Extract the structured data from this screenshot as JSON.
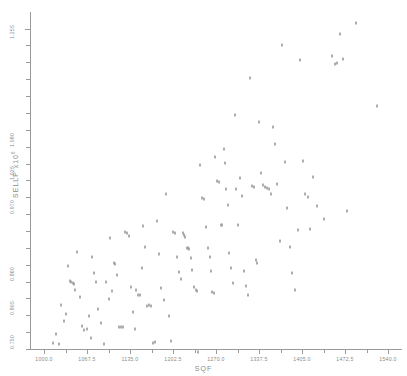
{
  "header": {
    "smudge_text": "· · ·"
  },
  "axis": {
    "x_title": "SQF",
    "y_title_main": "SELLP  x10",
    "y_title_exp": "6"
  },
  "chart_data": {
    "type": "scatter",
    "title": "",
    "xlabel": "SQF",
    "ylabel": "SELLP x10^6",
    "grid": false,
    "legend": null,
    "xlim": [
      978.0,
      1562.0
    ],
    "ylim": [
      0.7335,
      1.283
    ],
    "xticks": [
      1000.0,
      1067.5,
      1135.0,
      1202.5,
      1270.0,
      1337.5,
      1405.0,
      1472.5,
      1540.0
    ],
    "xtick_labels": [
      "1000.0",
      "1067.5",
      "1135.0",
      "1202.5",
      "1270.0",
      "1337.5",
      "1405.0",
      "1472.5",
      "1540.0"
    ],
    "x_minor_step": 33.75,
    "yticks": [
      0.75,
      0.805,
      0.86,
      0.915,
      0.97,
      1.025,
      1.08,
      1.135,
      1.19,
      1.255
    ],
    "ytick_labels": [
      "0.750",
      "0.805",
      "0.860",
      "0.915",
      "0.970",
      "1.025",
      "1.080",
      "1.135",
      "1.190",
      "1.255"
    ],
    "labeled_yticks": [
      "0.750",
      "0.805",
      "0.860",
      "0.970",
      "1.025",
      "1.080",
      "1.255"
    ],
    "marker": "small-dot",
    "n_points": 142,
    "points": [
      [
        1014,
        0.743
      ],
      [
        1019,
        0.758
      ],
      [
        1023,
        0.742
      ],
      [
        1027,
        0.8055
      ],
      [
        1031,
        0.78
      ],
      [
        1035,
        0.79
      ],
      [
        1038,
        0.869
      ],
      [
        1040,
        0.844
      ],
      [
        1043,
        0.843
      ],
      [
        1045,
        0.841
      ],
      [
        1047,
        0.839
      ],
      [
        1049,
        0.8295
      ],
      [
        1052,
        0.891
      ],
      [
        1056,
        0.818
      ],
      [
        1060,
        0.771
      ],
      [
        1063,
        0.764
      ],
      [
        1067,
        0.767
      ],
      [
        1070,
        0.787
      ],
      [
        1073,
        0.752
      ],
      [
        1076,
        0.883
      ],
      [
        1079,
        0.858
      ],
      [
        1082,
        0.843
      ],
      [
        1085,
        0.798
      ],
      [
        1090,
        0.776
      ],
      [
        1094,
        0.742
      ],
      [
        1098,
        0.843
      ],
      [
        1102,
        0.815
      ],
      [
        1104,
        0.914
      ],
      [
        1107,
        0.828
      ],
      [
        1110,
        0.873
      ],
      [
        1112,
        0.872
      ],
      [
        1115,
        0.854
      ],
      [
        1118,
        0.77
      ],
      [
        1121,
        0.77
      ],
      [
        1124,
        0.769
      ],
      [
        1127,
        0.924
      ],
      [
        1130,
        0.923
      ],
      [
        1133,
        0.918
      ],
      [
        1136,
        0.835
      ],
      [
        1139,
        0.794
      ],
      [
        1142,
        0.766
      ],
      [
        1145,
        0.829
      ],
      [
        1148,
        0.822
      ],
      [
        1151,
        0.821
      ],
      [
        1153,
        0.866
      ],
      [
        1156,
        0.934
      ],
      [
        1159,
        0.9
      ],
      [
        1162,
        0.804
      ],
      [
        1165,
        0.805
      ],
      [
        1168,
        0.803
      ],
      [
        1171,
        0.744
      ],
      [
        1174,
        0.745
      ],
      [
        1177,
        0.942
      ],
      [
        1180,
        0.888
      ],
      [
        1184,
        0.833
      ],
      [
        1188,
        0.813
      ],
      [
        1192,
        0.987
      ],
      [
        1196,
        0.788
      ],
      [
        1200,
        0.746
      ],
      [
        1203,
        0.924
      ],
      [
        1206,
        0.923
      ],
      [
        1209,
        0.883
      ],
      [
        1212,
        0.859
      ],
      [
        1215,
        0.847
      ],
      [
        1218,
        0.922
      ],
      [
        1220,
        0.92
      ],
      [
        1222,
        0.916
      ],
      [
        1224,
        0.899
      ],
      [
        1226,
        0.898
      ],
      [
        1228,
        0.896
      ],
      [
        1230,
        0.882
      ],
      [
        1233,
        0.862
      ],
      [
        1236,
        0.835
      ],
      [
        1238,
        0.83
      ],
      [
        1240,
        0.828
      ],
      [
        1242,
        0.729
      ],
      [
        1245,
        1.034
      ],
      [
        1248,
        0.979
      ],
      [
        1251,
        0.978
      ],
      [
        1254,
        0.932
      ],
      [
        1257,
        0.898
      ],
      [
        1260,
        0.884
      ],
      [
        1262,
        0.861
      ],
      [
        1264,
        0.826
      ],
      [
        1266,
        0.825
      ],
      [
        1269,
        1.047
      ],
      [
        1272,
        1.007
      ],
      [
        1275,
        1.006
      ],
      [
        1277,
        0.936
      ],
      [
        1280,
        0.935
      ],
      [
        1282,
        1.06
      ],
      [
        1284,
        1.037
      ],
      [
        1286,
        0.995
      ],
      [
        1288,
        0.968
      ],
      [
        1290,
        0.89
      ],
      [
        1293,
        0.865
      ],
      [
        1296,
        0.842
      ],
      [
        1299,
        1.115
      ],
      [
        1302,
        0.994
      ],
      [
        1305,
        0.935
      ],
      [
        1308,
        1.013
      ],
      [
        1311,
        0.983
      ],
      [
        1314,
        0.861
      ],
      [
        1317,
        0.837
      ],
      [
        1320,
        0.822
      ],
      [
        1323,
        1.176
      ],
      [
        1326,
        1.0
      ],
      [
        1329,
        0.998
      ],
      [
        1332,
        0.879
      ],
      [
        1335,
        0.873
      ],
      [
        1338,
        1.104
      ],
      [
        1341,
        1.02
      ],
      [
        1344,
        1.001
      ],
      [
        1347,
        0.997
      ],
      [
        1350,
        0.996
      ],
      [
        1353,
        0.995
      ],
      [
        1356,
        0.986
      ],
      [
        1359,
        1.096
      ],
      [
        1362,
        1.068
      ],
      [
        1366,
        1.002
      ],
      [
        1370,
        0.91
      ],
      [
        1374,
        1.229
      ],
      [
        1378,
        1.039
      ],
      [
        1382,
        0.964
      ],
      [
        1386,
        0.9
      ],
      [
        1390,
        0.857
      ],
      [
        1394,
        0.829
      ],
      [
        1398,
        0.928
      ],
      [
        1402,
        1.205
      ],
      [
        1406,
        1.04
      ],
      [
        1410,
        0.986
      ],
      [
        1414,
        0.982
      ],
      [
        1418,
        0.929
      ],
      [
        1422,
        1.014
      ],
      [
        1428,
        0.966
      ],
      [
        1440,
        0.946
      ],
      [
        1452,
        1.212
      ],
      [
        1456,
        1.199
      ],
      [
        1460,
        1.2
      ],
      [
        1464,
        1.248
      ],
      [
        1470,
        1.206
      ],
      [
        1476,
        0.958
      ],
      [
        1490,
        1.265
      ],
      [
        1523,
        1.13
      ]
    ]
  }
}
